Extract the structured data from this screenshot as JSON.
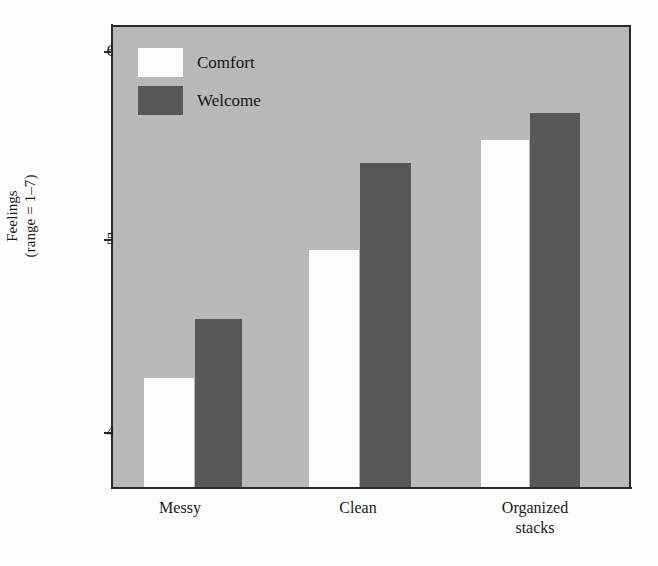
{
  "chart_data": {
    "type": "bar",
    "title": "",
    "xlabel": "",
    "ylabel": "Feelings\n(range = 1–7)",
    "ylabel_lines": [
      "Feelings",
      "(range = 1–7)"
    ],
    "categories": [
      "Messy",
      "Clean",
      "Organized stacks"
    ],
    "category_label_lines": [
      [
        "Messy"
      ],
      [
        "Clean"
      ],
      [
        "Organized",
        "stacks"
      ]
    ],
    "series": [
      {
        "name": "Comfort",
        "color": "#fcfcfc",
        "values": [
          4.28,
          4.95,
          5.53
        ]
      },
      {
        "name": "Welcome",
        "color": "#585858",
        "values": [
          4.59,
          5.41,
          5.67
        ]
      }
    ],
    "ylim": [
      3.71,
      6.12
    ],
    "yticks": [
      6,
      5,
      4
    ],
    "ytick_labels": [
      "6",
      "5",
      "4"
    ],
    "grid": false,
    "legend_position": "top-left-inside",
    "plot_background": "#b9b9b9",
    "axis_color": "#2b2b2b"
  },
  "legend": {
    "entries": [
      {
        "label": "Comfort",
        "swatch": "comfort"
      },
      {
        "label": "Welcome",
        "swatch": "welcome"
      }
    ]
  },
  "axes": {
    "y_title_line1": "Feelings",
    "y_title_line2": "(range = 1–7)",
    "ytick_0": "6",
    "ytick_1": "5",
    "ytick_2": "4"
  },
  "categories": {
    "cat_0_line1": "Messy",
    "cat_1_line1": "Clean",
    "cat_2_line1": "Organized",
    "cat_2_line2": "stacks"
  }
}
